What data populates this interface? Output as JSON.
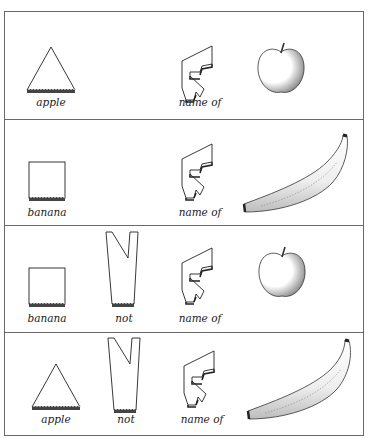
{
  "figure": {
    "rows": [
      {
        "tokens": [
          {
            "shape": "triangle",
            "label": "apple"
          },
          {
            "shape": "name-of",
            "label": "name of"
          }
        ],
        "object": "apple"
      },
      {
        "tokens": [
          {
            "shape": "square",
            "label": "banana"
          },
          {
            "shape": "name-of",
            "label": "name of"
          }
        ],
        "object": "banana"
      },
      {
        "tokens": [
          {
            "shape": "square",
            "label": "banana"
          },
          {
            "shape": "not",
            "label": "not"
          },
          {
            "shape": "name-of",
            "label": "name of"
          }
        ],
        "object": "apple"
      },
      {
        "tokens": [
          {
            "shape": "triangle",
            "label": "apple"
          },
          {
            "shape": "not",
            "label": "not"
          },
          {
            "shape": "name-of",
            "label": "name of"
          }
        ],
        "object": "banana"
      }
    ]
  },
  "colors": {
    "ink": "#222222",
    "border": "#6a6a6a",
    "background": "#ffffff"
  }
}
